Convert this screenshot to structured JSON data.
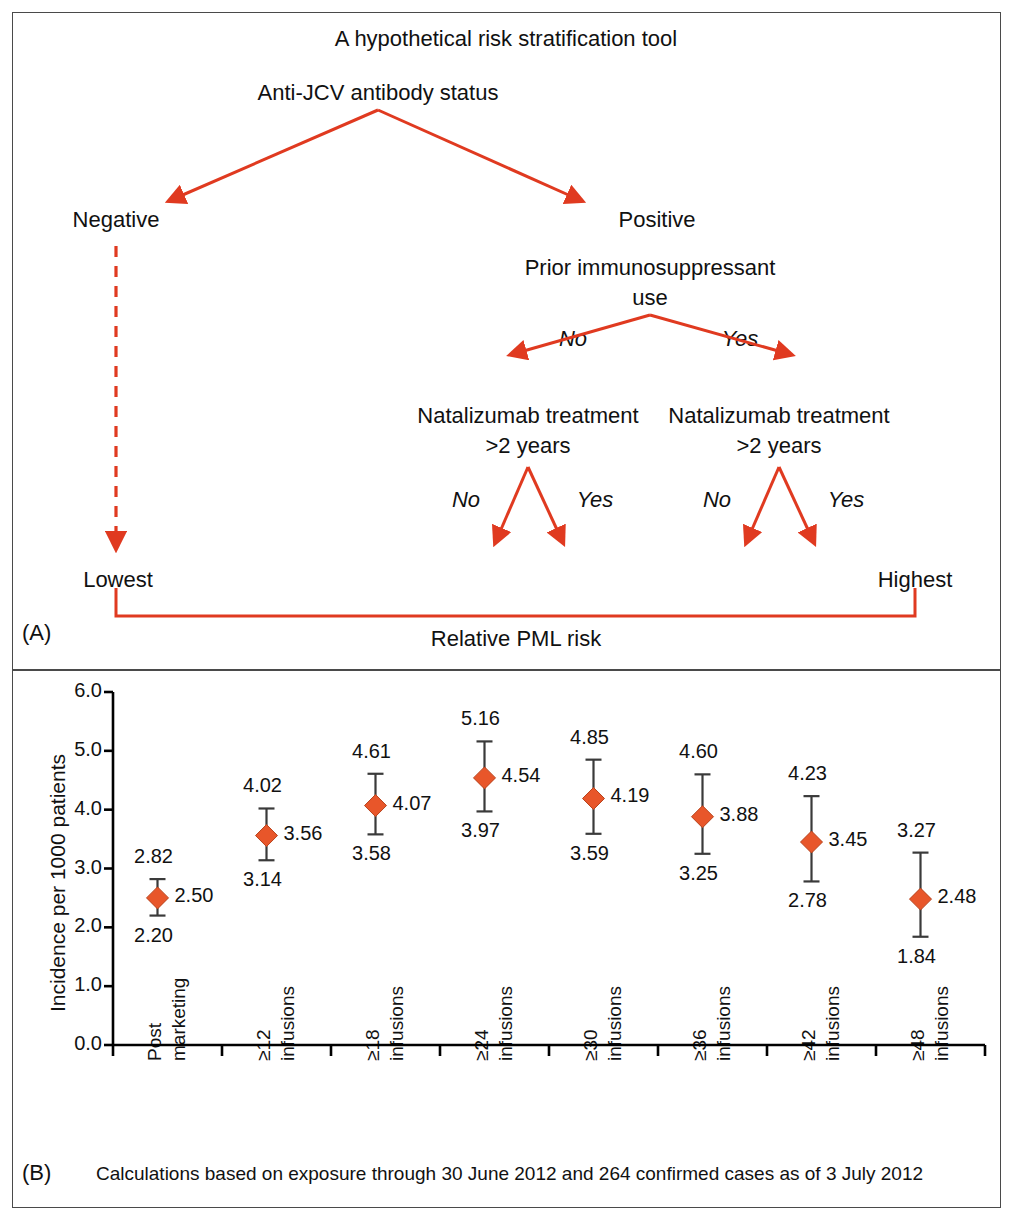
{
  "panel_a": {
    "letter": "(A)",
    "title": "A hypothetical risk stratification tool",
    "root": "Anti-JCV antibody status",
    "branch_negative": "Negative",
    "branch_positive": "Positive",
    "node_immunosuppressant_line1": "Prior immunosuppressant",
    "node_immunosuppressant_line2": "use",
    "edge_imm_no": "No",
    "edge_imm_yes": "Yes",
    "node_natalizumab_left_line1": "Natalizumab treatment",
    "node_natalizumab_left_line2": ">2 years",
    "node_natalizumab_right_line1": "Natalizumab treatment",
    "node_natalizumab_right_line2": ">2 years",
    "edge_nat_left_no": "No",
    "edge_nat_left_yes": "Yes",
    "edge_nat_right_no": "No",
    "edge_nat_right_yes": "Yes",
    "risk_lowest": "Lowest",
    "risk_highest": "Highest",
    "scale_label": "Relative PML risk",
    "accent_color": "#E03A20"
  },
  "panel_b": {
    "letter": "(B)",
    "caption": "Calculations based on exposure through 30 June 2012 and 264 confirmed cases as of 3 July 2012",
    "marker_color": "#E8562A",
    "axis_color": "#000000"
  },
  "chart_data": {
    "type": "scatter",
    "title": "",
    "xlabel": "",
    "ylabel": "Incidence per 1000 patients",
    "ylim": [
      0.0,
      6.0
    ],
    "yticks": [
      "0.0",
      "1.0",
      "2.0",
      "3.0",
      "4.0",
      "5.0",
      "6.0"
    ],
    "grid": false,
    "legend": "none",
    "categories": [
      "Post marketing",
      "≥12 infusions",
      "≥18 infusions",
      "≥24 infusions",
      "≥30 infusions",
      "≥36 infusions",
      "≥42 infusions",
      "≥48 infusions"
    ],
    "category_lines": [
      [
        "Post",
        "marketing"
      ],
      [
        "≥12",
        "infusions"
      ],
      [
        "≥18",
        "infusions"
      ],
      [
        "≥24",
        "infusions"
      ],
      [
        "≥30",
        "infusions"
      ],
      [
        "≥36",
        "infusions"
      ],
      [
        "≥42",
        "infusions"
      ],
      [
        "≥48",
        "infusions"
      ]
    ],
    "values": [
      2.5,
      3.56,
      4.07,
      4.54,
      4.19,
      3.88,
      3.45,
      2.48
    ],
    "upper": [
      2.82,
      4.02,
      4.61,
      5.16,
      4.85,
      4.6,
      4.23,
      3.27
    ],
    "lower": [
      2.2,
      3.14,
      3.58,
      3.97,
      3.59,
      3.25,
      2.78,
      1.84
    ],
    "value_labels": [
      "2.50",
      "3.56",
      "4.07",
      "4.54",
      "4.19",
      "3.88",
      "3.45",
      "2.48"
    ],
    "upper_labels": [
      "2.82",
      "4.02",
      "4.61",
      "5.16",
      "4.85",
      "4.60",
      "4.23",
      "3.27"
    ],
    "lower_labels": [
      "2.20",
      "3.14",
      "3.58",
      "3.97",
      "3.59",
      "3.25",
      "2.78",
      "1.84"
    ]
  }
}
